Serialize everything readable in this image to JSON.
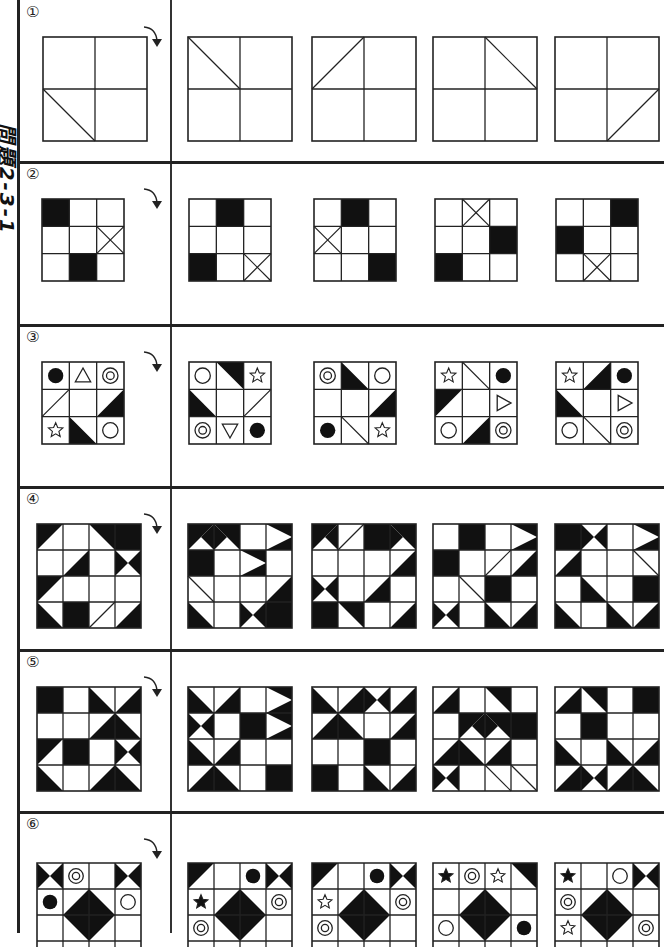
{
  "page": {
    "side_title": "問題2-3-1",
    "colors": {
      "ink": "#222222",
      "fill": "#111111",
      "background": "#ffffff"
    }
  },
  "rows": [
    {
      "number": "①",
      "grid": 2,
      "question": {
        "cells": [
          [
            "e",
            "e"
          ],
          [
            "d\\",
            "e"
          ]
        ]
      },
      "options": [
        {
          "cells": [
            [
              "d\\",
              "e"
            ],
            [
              "e",
              "e"
            ]
          ]
        },
        {
          "cells": [
            [
              "d/",
              "e"
            ],
            [
              "e",
              "e"
            ]
          ]
        },
        {
          "cells": [
            [
              "e",
              "d\\"
            ],
            [
              "e",
              "e"
            ]
          ]
        },
        {
          "cells": [
            [
              "e",
              "e"
            ],
            [
              "e",
              "d/"
            ]
          ]
        }
      ]
    },
    {
      "number": "②",
      "grid": 3,
      "question": {
        "cells": [
          [
            "b",
            "e",
            "e"
          ],
          [
            "e",
            "e",
            "x"
          ],
          [
            "e",
            "b",
            "e"
          ]
        ]
      },
      "options": [
        {
          "cells": [
            [
              "e",
              "b",
              "e"
            ],
            [
              "e",
              "e",
              "e"
            ],
            [
              "b",
              "e",
              "x"
            ]
          ]
        },
        {
          "cells": [
            [
              "e",
              "b",
              "e"
            ],
            [
              "x",
              "e",
              "e"
            ],
            [
              "e",
              "e",
              "b"
            ]
          ]
        },
        {
          "cells": [
            [
              "e",
              "x",
              "e"
            ],
            [
              "e",
              "e",
              "b"
            ],
            [
              "b",
              "e",
              "e"
            ]
          ]
        },
        {
          "cells": [
            [
              "e",
              "e",
              "b"
            ],
            [
              "b",
              "e",
              "e"
            ],
            [
              "e",
              "x",
              "e"
            ]
          ]
        }
      ]
    },
    {
      "number": "③",
      "grid": 3,
      "question": {
        "cells": [
          [
            "fc",
            "tu",
            "dc"
          ],
          [
            "d/",
            "e",
            "tBR-tr"
          ],
          [
            "st",
            "tBL-bl",
            "c"
          ]
        ]
      },
      "options": [
        {
          "cells": [
            [
              "c",
              "tTR-tr",
              "st"
            ],
            [
              "tBL-bl",
              "e",
              "d/"
            ],
            [
              "dc",
              "td",
              "fc"
            ]
          ]
        },
        {
          "cells": [
            [
              "dc",
              "tTR-bl",
              "c"
            ],
            [
              "e",
              "e",
              "tBR-tr"
            ],
            [
              "fc",
              "d\\",
              "st"
            ]
          ]
        },
        {
          "cells": [
            [
              "st",
              "d\\",
              "fc"
            ],
            [
              "tTL-tl",
              "e",
              "tr"
            ],
            [
              "c",
              "tBR-tr",
              "dc"
            ]
          ]
        },
        {
          "cells": [
            [
              "st",
              "tTR-br",
              "fc"
            ],
            [
              "tBL-tr",
              "e",
              "tr"
            ],
            [
              "c",
              "d\\",
              "dc"
            ]
          ]
        }
      ]
    },
    {
      "number": "④",
      "grid": 4,
      "question": {
        "cells": [
          [
            "TL",
            "e",
            "TR",
            "b"
          ],
          [
            "e",
            "BR",
            "e",
            "hx"
          ],
          [
            "TL",
            "e",
            "e",
            "e"
          ],
          [
            "BL",
            "b",
            "d/",
            "BR"
          ]
        ]
      },
      "options": [
        {
          "cells": [
            [
              "BRw",
              "BLw",
              "e",
              "TRw"
            ],
            [
              "b",
              "e",
              "TRw",
              "e"
            ],
            [
              "d\\",
              "e",
              "e",
              "BR"
            ],
            [
              "BL",
              "e",
              "hx",
              "b"
            ]
          ]
        },
        {
          "cells": [
            [
              "BRw",
              "d/",
              "b",
              "BLw"
            ],
            [
              "e",
              "e",
              "e",
              "BR"
            ],
            [
              "hx",
              "e",
              "BR",
              "e"
            ],
            [
              "b",
              "TR",
              "e",
              "BR"
            ]
          ]
        },
        {
          "cells": [
            [
              "e",
              "b",
              "e",
              "TRw"
            ],
            [
              "b",
              "e",
              "d/",
              "BR"
            ],
            [
              "e",
              "d\\",
              "b",
              "e"
            ],
            [
              "hx",
              "e",
              "BL",
              "BR"
            ]
          ]
        },
        {
          "cells": [
            [
              "b",
              "hx",
              "e",
              "TRw"
            ],
            [
              "BR",
              "e",
              "e",
              "d\\"
            ],
            [
              "e",
              "BL",
              "e",
              "b"
            ],
            [
              "BL",
              "e",
              "BL",
              "BR"
            ]
          ]
        }
      ]
    },
    {
      "number": "⑤",
      "grid": 4,
      "question": {
        "cells": [
          [
            "b",
            "e",
            "BL",
            "BR"
          ],
          [
            "e",
            "e",
            "BR",
            "BL"
          ],
          [
            "TL",
            "b",
            "e",
            "hx"
          ],
          [
            "BL",
            "e",
            "BR",
            "BL"
          ]
        ]
      },
      "options": [
        {
          "cells": [
            [
              "BL",
              "BR",
              "e",
              "TRw"
            ],
            [
              "hx",
              "e",
              "b",
              "TRw"
            ],
            [
              "BL",
              "BR",
              "e",
              "e"
            ],
            [
              "BR",
              "BL",
              "e",
              "b"
            ]
          ]
        },
        {
          "cells": [
            [
              "BL",
              "BR",
              "hx",
              "BR"
            ],
            [
              "BR",
              "BL",
              "e",
              "BR"
            ],
            [
              "e",
              "e",
              "b",
              "e"
            ],
            [
              "b",
              "e",
              "BL",
              "BR"
            ]
          ]
        },
        {
          "cells": [
            [
              "BR",
              "e",
              "TR",
              "e"
            ],
            [
              "e",
              "BRw",
              "BLw",
              "b"
            ],
            [
              "BR",
              "BL",
              "BR",
              "e"
            ],
            [
              "hx",
              "e",
              "d\\",
              "d\\"
            ]
          ]
        },
        {
          "cells": [
            [
              "BR",
              "TR",
              "e",
              "b"
            ],
            [
              "e",
              "b",
              "e",
              "e"
            ],
            [
              "BL",
              "e",
              "BL",
              "BR"
            ],
            [
              "BR",
              "hx",
              "BR",
              "BL"
            ]
          ]
        }
      ]
    },
    {
      "number": "⑥",
      "grid": 4,
      "question": {
        "cells": [
          [
            "hx",
            "dc",
            "e",
            "hx"
          ],
          [
            "fc",
            "BR",
            "BL",
            "c"
          ],
          [
            "e",
            "TR",
            "TL",
            "e"
          ]
        ]
      },
      "options": [
        {
          "cells": [
            [
              "TL",
              "e",
              "fc",
              "hx"
            ],
            [
              "fs",
              "BR",
              "BL",
              "dc"
            ],
            [
              "dc",
              "TR",
              "TL",
              "e"
            ]
          ]
        },
        {
          "cells": [
            [
              "TL",
              "e",
              "fc",
              "hx"
            ],
            [
              "st",
              "BR",
              "BL",
              "dc"
            ],
            [
              "dc",
              "TR",
              "TL",
              "e"
            ]
          ]
        },
        {
          "cells": [
            [
              "fs",
              "dc",
              "st",
              "TR"
            ],
            [
              "e",
              "BR",
              "BL",
              "e"
            ],
            [
              "c",
              "TR",
              "TL",
              "fc"
            ]
          ]
        },
        {
          "cells": [
            [
              "fs",
              "e",
              "c",
              "hx"
            ],
            [
              "dc",
              "BR",
              "BL",
              "e"
            ],
            [
              "st",
              "TR",
              "TL",
              "dc"
            ]
          ]
        }
      ]
    }
  ]
}
